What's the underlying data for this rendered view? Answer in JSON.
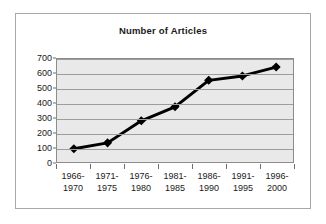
{
  "chart_data": {
    "type": "line",
    "title": "Number of Articles",
    "xlabel": "",
    "ylabel": "",
    "categories": [
      "1966-1970",
      "1971-1975",
      "1976-1980",
      "1981-1985",
      "1986-1990",
      "1991-1995",
      "1996-2000"
    ],
    "category_lines": [
      [
        "1966-",
        "1970"
      ],
      [
        "1971-",
        "1975"
      ],
      [
        "1976-",
        "1980"
      ],
      [
        "1981-",
        "1985"
      ],
      [
        "1986-",
        "1990"
      ],
      [
        "1991-",
        "1995"
      ],
      [
        "1996-",
        "2000"
      ]
    ],
    "values": [
      90,
      130,
      280,
      375,
      555,
      585,
      645
    ],
    "ylim": [
      0,
      700
    ],
    "ytick_step": 100,
    "yticks": [
      0,
      100,
      200,
      300,
      400,
      500,
      600,
      700
    ],
    "ytick_labels": [
      "0",
      "100",
      "200",
      "300",
      "400",
      "500",
      "600",
      "700"
    ],
    "grid": true,
    "grid_axis": "y",
    "legend": false,
    "legend_position": "none",
    "series": [
      {
        "name": "Number of Articles",
        "values": [
          90,
          130,
          280,
          375,
          555,
          585,
          645
        ],
        "color": "#000000",
        "marker": "diamond",
        "line_width": 3
      }
    ],
    "colors": {
      "plot_background": "#e9e9e9",
      "chart_background": "#ffffff",
      "gridline": "#9d9d9d",
      "axis": "#6e6e6e",
      "border": "#8c8c8c",
      "frame_border": "#a8a8a8",
      "text": "#1a1a1a",
      "series": "#000000"
    }
  }
}
